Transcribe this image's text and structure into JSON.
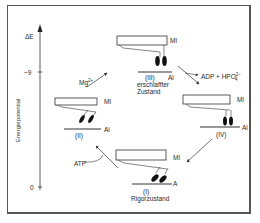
{
  "figure": {
    "y_axis": {
      "label": "Energiepotential",
      "top_label": "ΔE",
      "ticks": [
        {
          "label": "~9",
          "y": 72
        },
        {
          "label": "0",
          "y": 187
        }
      ]
    },
    "states": [
      {
        "id": "I",
        "roman": "(I)",
        "name": "Rigorzustand",
        "myosin_label": "Ml",
        "actin_label": "A"
      },
      {
        "id": "II",
        "roman": "(II)",
        "name": "",
        "myosin_label": "Ml",
        "actin_label": "Al"
      },
      {
        "id": "III",
        "roman": "(III)",
        "name_line1": "erschlaffter",
        "name_line2": "Zustand",
        "myosin_label": "Ml",
        "actin_label": "Al"
      },
      {
        "id": "IV",
        "roman": "(IV)",
        "name": "",
        "myosin_label": "Ml",
        "actin_label": "Al"
      }
    ],
    "transitions": [
      {
        "from": "II",
        "to": "III",
        "label": "Mg",
        "label_sup": "2+"
      },
      {
        "from": "III",
        "to": "IV",
        "label": "ADP + HPO",
        "label_sup": "2−",
        "label_sub": "4"
      },
      {
        "from": "IV",
        "to": "I",
        "label": ""
      },
      {
        "from": "I",
        "to": "II",
        "label": "ATP"
      }
    ]
  }
}
